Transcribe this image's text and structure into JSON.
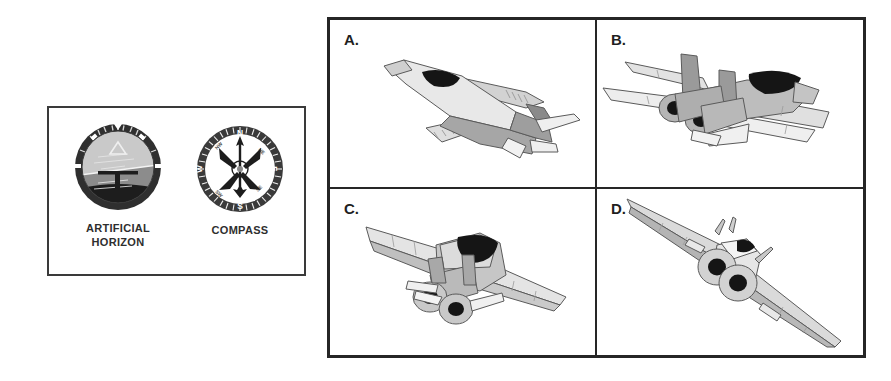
{
  "figure": {
    "background_color": "#ffffff",
    "width": 891,
    "height": 381
  },
  "instrument_panel": {
    "border_color": "#3a3a3a",
    "instruments": [
      {
        "id": "artificial-horizon",
        "icon": "artificial-horizon-gauge",
        "label_line1": "ARTIFICIAL",
        "label_line2": "HORIZON",
        "colors": {
          "bezel": "#2f2f2f",
          "sky": "#c9c9c9",
          "ground": "#8c8c8c",
          "lower_ground": "#1d1d1d",
          "pointer": "#e8e8e8"
        }
      },
      {
        "id": "compass",
        "icon": "compass-gauge",
        "label_line1": "COMPASS",
        "label_line2": "",
        "cardinals": [
          "N",
          "E",
          "S",
          "W"
        ],
        "intercardinals": [
          "NW",
          "NE",
          "SE",
          "SW"
        ],
        "colors": {
          "bezel": "#3a3a3a",
          "face": "#ffffff",
          "needle": "#1d1d1d"
        }
      }
    ]
  },
  "aircraft_grid": {
    "border_color": "#262626",
    "cells": [
      {
        "id": "cell-a",
        "label": "A.",
        "icon": "jet-aircraft-banking-top-rear-view",
        "description": "Jet aircraft seen from above and behind, banking left, swept wings, single tail"
      },
      {
        "id": "cell-b",
        "label": "B.",
        "icon": "jet-aircraft-twin-tail-rear-view",
        "description": "Jet aircraft seen from directly behind, twin vertical tails, twin engine exhausts"
      },
      {
        "id": "cell-c",
        "label": "C.",
        "icon": "jet-aircraft-rear-quarter-view",
        "description": "Jet aircraft seen from behind and slightly above, dark canopy, twin engine nozzles"
      },
      {
        "id": "cell-d",
        "label": "D.",
        "icon": "jet-aircraft-steep-bank-rear-view",
        "description": "Jet aircraft seen from directly behind in a steep bank, long swept wings, twin exhausts"
      }
    ]
  },
  "palette": {
    "aircraft_light": "#d2d2d2",
    "aircraft_mid": "#a6a6a6",
    "aircraft_dark": "#7a7a7a",
    "aircraft_white": "#f2f2f2",
    "canopy_black": "#151515",
    "outline": "#5a5a5a"
  }
}
